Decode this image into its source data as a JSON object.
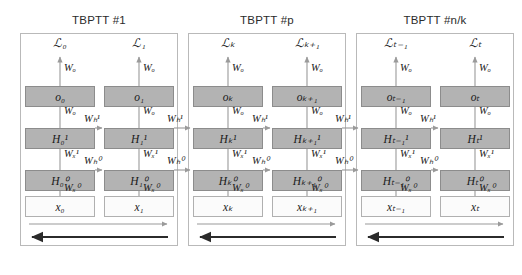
{
  "figure": {
    "title_prefix": "TBPTT",
    "background": "#ffffff",
    "block_gray": "#b3b3b3",
    "block_white": "#fbfbfb",
    "arrow_forward_color": "#9a9a9a",
    "arrow_backward_color": "#2b2b2b"
  },
  "panels": [
    {
      "title": "TBPTT #1",
      "columns": [
        {
          "loss": "ℒ₀",
          "output": "o₀",
          "hidden1": "H₀¹",
          "hidden0": "H₀⁰",
          "input": "x₀",
          "w_out_top": "Wₒ",
          "w_out_mid": "Wₒ",
          "w_x1": "Wₓ¹",
          "w_x0": "Wₓ⁰"
        },
        {
          "loss": "ℒ₁",
          "output": "o₁",
          "hidden1": "H₁¹",
          "hidden0": "H₁⁰",
          "input": "x₁",
          "w_out_top": "Wₒ",
          "w_out_mid": "Wₒ",
          "w_x1": "Wₓ¹",
          "w_x0": "Wₓ⁰"
        }
      ],
      "w_h1_inner": "Wₕ¹",
      "w_h0_inner": "Wₕ⁰"
    },
    {
      "title": "TBPTT #p",
      "columns": [
        {
          "loss": "ℒₖ",
          "output": "oₖ",
          "hidden1": "Hₖ¹",
          "hidden0": "Hₖ⁰",
          "input": "xₖ",
          "w_out_top": "Wₒ",
          "w_out_mid": "Wₒ",
          "w_x1": "Wₓ¹",
          "w_x0": "Wₓ⁰"
        },
        {
          "loss": "ℒₖ₊₁",
          "output": "oₖ₊₁",
          "hidden1": "Hₖ₊₁¹",
          "hidden0": "Hₖ₊₁⁰",
          "input": "xₖ₊₁",
          "w_out_top": "Wₒ",
          "w_out_mid": "Wₒ",
          "w_x1": "Wₓ¹",
          "w_x0": "Wₓ⁰"
        }
      ],
      "w_h1_inner": "Wₕ¹",
      "w_h0_inner": "Wₕ⁰"
    },
    {
      "title": "TBPTT #n/k",
      "columns": [
        {
          "loss": "ℒₜ₋₁",
          "output": "oₜ₋₁",
          "hidden1": "Hₜ₋₁¹",
          "hidden0": "Hₜ₋₁⁰",
          "input": "xₜ₋₁",
          "w_out_top": "Wₒ",
          "w_out_mid": "Wₒ",
          "w_x1": "Wₓ¹",
          "w_x0": "Wₓ⁰"
        },
        {
          "loss": "ℒₜ",
          "output": "oₜ",
          "hidden1": "Hₜ¹",
          "hidden0": "Hₜ⁰",
          "input": "xₜ",
          "w_out_top": "Wₒ",
          "w_out_mid": "Wₒ",
          "w_x1": "Wₓ¹",
          "w_x0": "Wₓ⁰"
        }
      ],
      "w_h1_inner": "Wₕ¹",
      "w_h0_inner": "Wₕ⁰"
    }
  ],
  "bridges": [
    {
      "w_h1": "Wₕ¹",
      "w_h0": "Wₕ⁰"
    },
    {
      "w_h1": "Wₕ¹",
      "w_h0": "Wₕ⁰"
    }
  ]
}
